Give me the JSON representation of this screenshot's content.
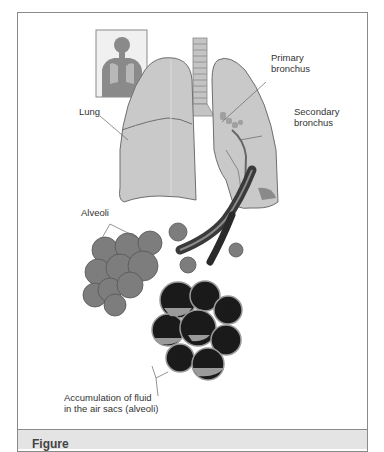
{
  "figure": {
    "labels": {
      "primary_bronchus": [
        "Primary",
        "bronchus"
      ],
      "lung": "Lung",
      "secondary_bronchus": [
        "Secondary",
        "bronchus"
      ],
      "alveoli": "Alveoli",
      "fluid": [
        "Accumulation of fluid",
        "in the air sacs (alveoli)"
      ]
    },
    "caption": "Figure"
  },
  "colors": {
    "frame": "#8a8a8a",
    "lung_fill": "#c9c9c9",
    "lung_stroke": "#6e6e6e",
    "alveoli_fill": "#7d7d7d",
    "alveoli_dark": "#1a1a1a",
    "caption_bg": "#e4e4e4"
  }
}
